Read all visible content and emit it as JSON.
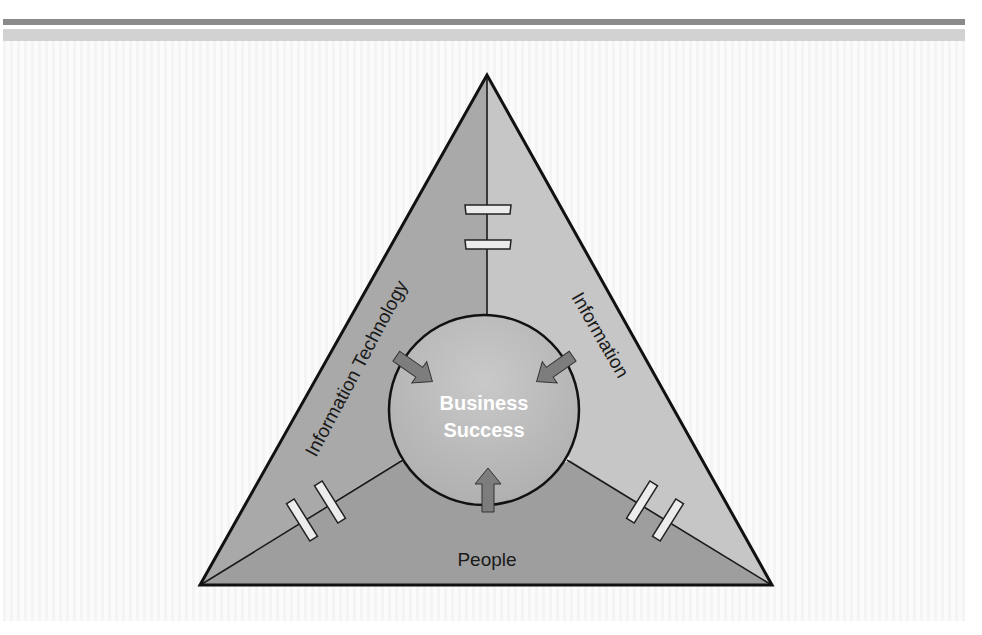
{
  "diagram": {
    "center_label_line1": "Business",
    "center_label_line2": "Success",
    "side_labels": {
      "left": "Information Technology",
      "right": "Information",
      "bottom": "People"
    },
    "colors": {
      "header_bar_dark": "#8a8a8a",
      "header_bar_light": "#d2d2d2",
      "triangle_left_face": "#a8a8a8",
      "triangle_right_face": "#c4c4c4",
      "triangle_bottom_face": "#9c9c9c",
      "circle_fill": "#bdbdbd",
      "arrow_fill": "#7a7a7a",
      "center_text": "#ffffff",
      "label_text": "#1a1a1a",
      "connector_clip": "#ececec"
    },
    "icons": [
      "arrow-into-center",
      "break-connector-clip"
    ]
  }
}
